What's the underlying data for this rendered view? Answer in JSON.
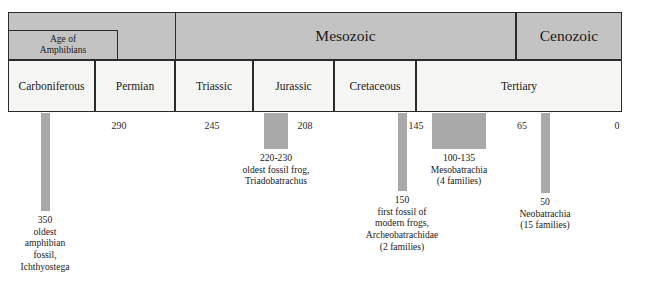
{
  "figure": {
    "kind": "geologic-timeline",
    "axis_unit": "millions of years before present"
  },
  "colors": {
    "header_fill": "#c3c3c3",
    "period_fill": "#f6f6f4",
    "bar_fill": "#a9a9a9",
    "border": "#2b2b2b",
    "text": "#1a1a1a",
    "background": "#ffffff"
  },
  "eras": [
    {
      "label": "Mesozoic",
      "left": 175,
      "width": 341
    },
    {
      "label": "Cenozoic",
      "left": 516,
      "width": 106
    }
  ],
  "sub_eras": [
    {
      "label_line1": "Age of",
      "label_line2": "Amphibians",
      "left": 8,
      "width": 110
    }
  ],
  "periods": [
    {
      "label": "Carboniferous",
      "left": 8,
      "width": 87
    },
    {
      "label": "Permian",
      "left": 95,
      "width": 80
    },
    {
      "label": "Triassic",
      "left": 175,
      "width": 78
    },
    {
      "label": "Jurassic",
      "left": 253,
      "width": 81
    },
    {
      "label": "Cretaceous",
      "left": 334,
      "width": 82
    },
    {
      "label": "Tertiary",
      "left": 416,
      "width": 206
    }
  ],
  "ticks": [
    {
      "label": "290",
      "x": 119
    },
    {
      "label": "245",
      "x": 212
    },
    {
      "label": "208",
      "x": 305
    },
    {
      "label": "145",
      "x": 416
    },
    {
      "label": "65",
      "x": 522
    },
    {
      "label": "0",
      "x": 617
    }
  ],
  "events": [
    {
      "id": "ichthyostega",
      "value": "350",
      "lines": [
        "oldest",
        "amphibian",
        "fossil,",
        "Ichthyostega"
      ],
      "bar": {
        "left": 41,
        "top": 113,
        "width": 9,
        "height": 98
      },
      "note_x": 45,
      "note_y": 214
    },
    {
      "id": "triadobatrachus",
      "value": "220-230",
      "lines": [
        "oldest fossil frog,",
        "Triadobatrachus"
      ],
      "bar": {
        "left": 264,
        "top": 113,
        "width": 24,
        "height": 36
      },
      "note_x": 276,
      "note_y": 152
    },
    {
      "id": "archeobatrachidae",
      "value": "150",
      "lines": [
        "first fossil of",
        "modern frogs,",
        "Archeobatrachidae",
        "(2 families)"
      ],
      "bar": {
        "left": 398,
        "top": 113,
        "width": 9,
        "height": 78
      },
      "note_x": 402,
      "note_y": 194
    },
    {
      "id": "mesobatrachia",
      "value": "100-135",
      "lines": [
        "Mesobatrachia",
        "(4 families)"
      ],
      "bar": {
        "left": 432,
        "top": 113,
        "width": 54,
        "height": 36
      },
      "note_x": 459,
      "note_y": 152
    },
    {
      "id": "neobatrachia",
      "value": "50",
      "lines": [
        "Neobatrachia",
        "(15 families)"
      ],
      "bar": {
        "left": 541,
        "top": 113,
        "width": 9,
        "height": 80
      },
      "note_x": 545,
      "note_y": 196
    }
  ]
}
